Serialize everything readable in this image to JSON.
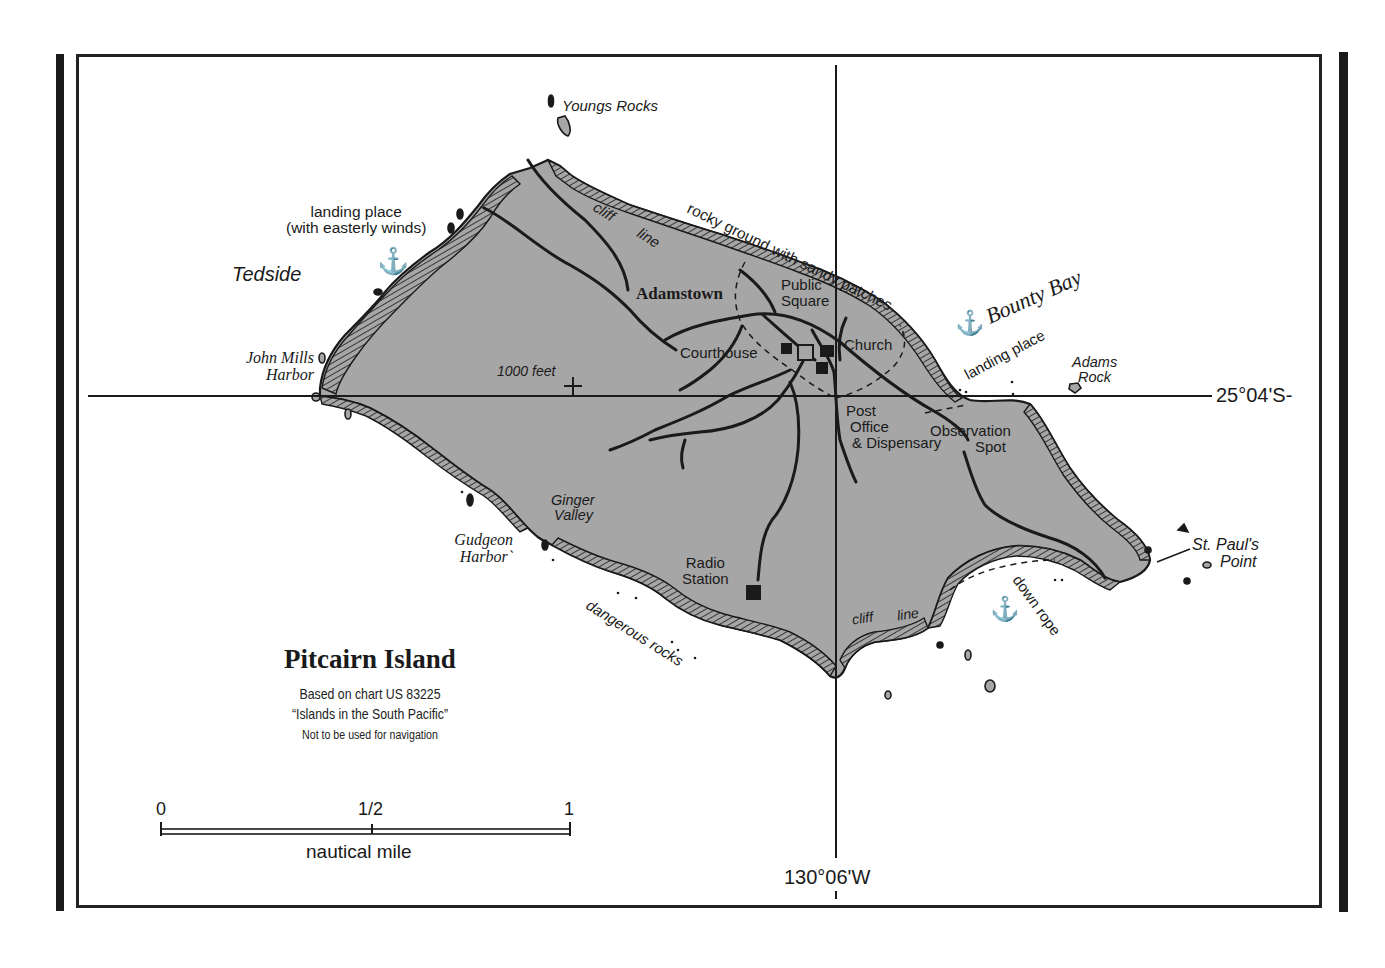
{
  "map": {
    "title": "Pitcairn Island",
    "source_line1": "Based on chart US 83225",
    "source_line2": "“Islands in the South Pacific”",
    "disclaimer": "Not to be used for navigation",
    "colors": {
      "land": "#a6a6a6",
      "ink": "#1a1a1a",
      "water": "#ffffff"
    },
    "gridlines": {
      "latitude": "25°04'S-",
      "longitude": "130°06'W"
    },
    "scale": {
      "ticks": [
        "0",
        "1/2",
        "1"
      ],
      "unit": "nautical mile"
    },
    "places": {
      "youngs_rocks": "Youngs Rocks",
      "landing_place_w_1": "landing place",
      "landing_place_w_2": "(with easterly winds)",
      "tedside": "Tedside",
      "john_mills_1": "John Mills",
      "john_mills_2": "Harbor",
      "cliff_line_n_1": "cliff",
      "cliff_line_n_2": "line",
      "rocky_ground": "rocky ground with sandy patches",
      "adamstown": "Adamstown",
      "public_square_1": "Public",
      "public_square_2": "Square",
      "bounty_bay": "Bounty Bay",
      "landing_place_e": "landing place",
      "courthouse": "Courthouse",
      "church": "Church",
      "elevation": "1000 feet",
      "adams_rock_1": "Adams",
      "adams_rock_2": "Rock",
      "post_office_1": "Post",
      "post_office_2": "Office",
      "post_office_3": "& Dispensary",
      "observation_1": "Observation",
      "observation_2": "Spot",
      "ginger_valley_1": "Ginger",
      "ginger_valley_2": "Valley",
      "gudgeon_1": "Gudgeon",
      "gudgeon_2": "Harbor`",
      "radio_station_1": "Radio",
      "radio_station_2": "Station",
      "st_pauls_1": "St. Paul's",
      "st_pauls_2": "Point",
      "dangerous_rocks": "dangerous rocks",
      "cliff_line_s_1": "cliff",
      "cliff_line_s_2": "line",
      "down_rope": "down rope"
    },
    "icons": {
      "anchor": "⚓"
    }
  }
}
